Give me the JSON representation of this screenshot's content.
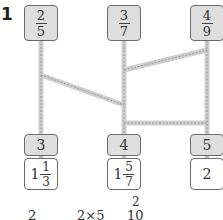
{
  "question_number": "1",
  "top_boxes": [
    {
      "num": "2",
      "den": "5"
    },
    {
      "num": "3",
      "den": "7"
    },
    {
      "num": "4",
      "den": "9"
    }
  ],
  "middle_boxes": [
    "3",
    "4",
    "5"
  ],
  "value_boxes": [
    {
      "whole": "1",
      "num": "1",
      "den": "3"
    },
    {
      "whole": "1",
      "num": "5",
      "den": "7"
    },
    {
      "whole": "2"
    }
  ],
  "bottom_partial_text": {
    "left": "2",
    "middle": "2×5",
    "superscript": "2",
    "right": "10"
  },
  "colors": {
    "box_fill": "#dedede",
    "rail": "#c8c8c8",
    "border": "#6b6b6b"
  }
}
